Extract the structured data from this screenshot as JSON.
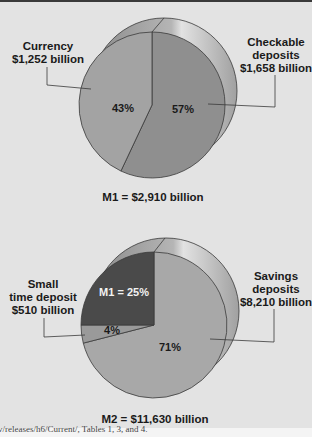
{
  "chart_data": [
    {
      "type": "pie",
      "title": "M1 = $2,910 billion",
      "total_billion": 2910,
      "slices": [
        {
          "name": "Currency",
          "label_line1": "Currency",
          "label_line2": "$1,252 billion",
          "value_billion": 1252,
          "percent": 43,
          "percent_label": "43%",
          "color": "#a3a3a3"
        },
        {
          "name": "Checkable deposits",
          "label_line1": "Checkable",
          "label_line2": "deposits",
          "label_line3": "$1,658 billion",
          "value_billion": 1658,
          "percent": 57,
          "percent_label": "57%",
          "color": "#8f8f8f"
        }
      ]
    },
    {
      "type": "pie",
      "title": "M2 = $11,630 billion",
      "total_billion": 11630,
      "slices": [
        {
          "name": "M1",
          "percent": 25,
          "percent_label": "M1 = 25%",
          "value_billion": 2910,
          "color": "#4a4a4a"
        },
        {
          "name": "Small time deposit",
          "label_line1": "Small",
          "label_line2": "time deposit",
          "label_line3": "$510 billion",
          "value_billion": 510,
          "percent": 4,
          "percent_label": "4%",
          "color": "#9a9a9a"
        },
        {
          "name": "Savings deposits",
          "label_line1": "Savings",
          "label_line2": "deposits",
          "label_line3": "$8,210 billion",
          "value_billion": 8210,
          "percent": 71,
          "percent_label": "71%",
          "color": "#a8a8a8"
        }
      ]
    }
  ],
  "footer": {
    "source_text": "v/releases/h6/Current/, Tables 1, 3, and 4."
  },
  "colors": {
    "background": "#e3e3e3",
    "back_disc": "#999999",
    "back_disc_highlight": "#d8d8d8",
    "outline": "#3a3a3a"
  }
}
